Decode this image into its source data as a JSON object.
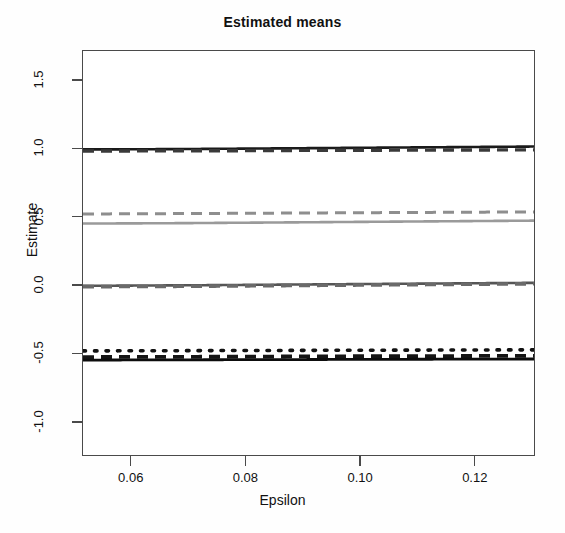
{
  "chart_data": {
    "type": "line",
    "title": "Estimated means",
    "xlabel": "Epsilon",
    "ylabel": "Estimate",
    "xlim": [
      0.0515,
      0.1305
    ],
    "ylim": [
      -1.25,
      1.72
    ],
    "grid": false,
    "legend": "none",
    "xticks": [
      0.06,
      0.08,
      0.1,
      0.12
    ],
    "xtick_labels": [
      "0.06",
      "0.08",
      "0.10",
      "0.12"
    ],
    "yticks": [
      1.5,
      1.0,
      0.5,
      0.0,
      -0.5,
      -1.0
    ],
    "ytick_labels": [
      "1.5",
      "1.0",
      "0.5",
      "0.0",
      "-0.5",
      "-1.0"
    ],
    "x": [
      0.052,
      0.06,
      0.07,
      0.08,
      0.09,
      0.1,
      0.11,
      0.12,
      0.13
    ],
    "series": [
      {
        "name": "upper-solid",
        "style": "solid",
        "color": "#1a1a1a",
        "width": 2.6,
        "values": [
          1.0,
          1.001,
          1.003,
          1.006,
          1.009,
          1.012,
          1.015,
          1.018,
          1.021
        ]
      },
      {
        "name": "upper-dashed",
        "style": "dashed",
        "color": "#3a3a3a",
        "width": 3.4,
        "values": [
          0.988,
          0.989,
          0.99,
          0.991,
          0.993,
          0.994,
          0.995,
          0.996,
          0.997
        ]
      },
      {
        "name": "mid-upper-dashed",
        "style": "dashed",
        "color": "#8e8e8e",
        "width": 3.0,
        "values": [
          0.528,
          0.529,
          0.531,
          0.533,
          0.535,
          0.537,
          0.539,
          0.541,
          0.543
        ]
      },
      {
        "name": "mid-upper-solid",
        "style": "solid",
        "color": "#9a9a9a",
        "width": 2.6,
        "values": [
          0.458,
          0.459,
          0.461,
          0.464,
          0.467,
          0.47,
          0.473,
          0.476,
          0.479
        ]
      },
      {
        "name": "zero-solid",
        "style": "solid",
        "color": "#555555",
        "width": 2.6,
        "values": [
          0.002,
          0.004,
          0.006,
          0.009,
          0.012,
          0.015,
          0.018,
          0.021,
          0.024
        ]
      },
      {
        "name": "zero-dashed",
        "style": "dashed",
        "color": "#6a6a6a",
        "width": 3.6,
        "values": [
          -0.004,
          -0.003,
          -0.001,
          0.002,
          0.005,
          0.008,
          0.011,
          0.014,
          0.017
        ]
      },
      {
        "name": "lower-dotted",
        "style": "dotted",
        "color": "#111111",
        "width": 3.6,
        "values": [
          -0.474,
          -0.473,
          -0.472,
          -0.471,
          -0.47,
          -0.469,
          -0.468,
          -0.467,
          -0.466
        ]
      },
      {
        "name": "lower-dashed",
        "style": "dashed",
        "color": "#151515",
        "width": 3.8,
        "values": [
          -0.519,
          -0.518,
          -0.517,
          -0.516,
          -0.514,
          -0.513,
          -0.512,
          -0.511,
          -0.51
        ]
      },
      {
        "name": "lower-solid",
        "style": "solid",
        "color": "#0d0d0d",
        "width": 2.8,
        "values": [
          -0.541,
          -0.54,
          -0.539,
          -0.538,
          -0.537,
          -0.536,
          -0.535,
          -0.534,
          -0.533
        ]
      }
    ]
  }
}
